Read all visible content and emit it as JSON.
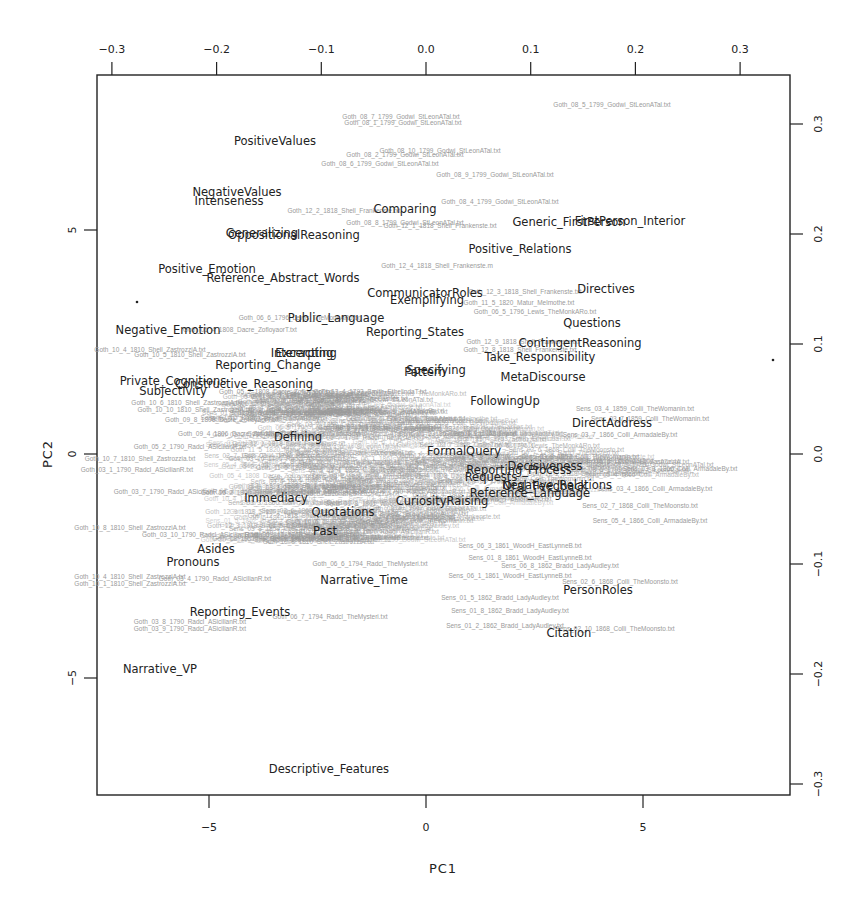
{
  "chart_data": {
    "type": "scatter",
    "subtype": "biplot",
    "title": "",
    "xlabel": "PC1",
    "ylabel": "PC2",
    "xlim": [
      -9.7,
      8.2
    ],
    "ylim": [
      -7.5,
      8.5
    ],
    "bottom_axis": {
      "ticks": [
        -5,
        0,
        5
      ],
      "tick_labels": [
        "−5",
        "0",
        "5"
      ]
    },
    "left_axis": {
      "ticks": [
        5,
        0,
        -5
      ],
      "tick_labels": [
        "5",
        "0",
        "−5"
      ]
    },
    "top_axis": {
      "ticks": [
        -0.3,
        -0.2,
        -0.1,
        0.0,
        0.1,
        0.2,
        0.3
      ],
      "tick_labels": [
        "−0.3",
        "−0.2",
        "−0.1",
        "0.0",
        "0.1",
        "0.2",
        "0.3"
      ]
    },
    "right_axis": {
      "ticks": [
        0.3,
        0.2,
        0.1,
        0.0,
        -0.1,
        -0.2,
        -0.3
      ],
      "tick_labels": [
        "0.3",
        "0.2",
        "0.1",
        "0.0",
        "−0.1",
        "−0.2",
        "−0.3"
      ]
    },
    "grid": false,
    "legend": null,
    "variable_loadings": [
      {
        "name": "PositiveValues",
        "px": 275,
        "py": 145
      },
      {
        "name": "NegativeValues",
        "px": 237,
        "py": 196
      },
      {
        "name": "Intenseness",
        "px": 229,
        "py": 205
      },
      {
        "name": "OppositionalReasoning",
        "px": 294,
        "py": 239
      },
      {
        "name": "Generalizing",
        "px": 262,
        "py": 237
      },
      {
        "name": "Comparing",
        "px": 405,
        "py": 213
      },
      {
        "name": "Generic_FirstPerson",
        "px": 569,
        "py": 226
      },
      {
        "name": "FirstPerson_Interior",
        "px": 630,
        "py": 225
      },
      {
        "name": "Positive_Relations",
        "px": 520,
        "py": 253
      },
      {
        "name": "Positive_Emotion",
        "px": 207,
        "py": 273
      },
      {
        "name": "Reference_Abstract_Words",
        "px": 283,
        "py": 282
      },
      {
        "name": "CommunicatorRoles",
        "px": 425,
        "py": 297
      },
      {
        "name": "Exemplifying",
        "px": 427,
        "py": 304
      },
      {
        "name": "Directives",
        "px": 606,
        "py": 293
      },
      {
        "name": "Public_Language",
        "px": 336,
        "py": 322
      },
      {
        "name": "Negative_Emotion",
        "px": 168,
        "py": 334
      },
      {
        "name": "Reporting_States",
        "px": 415,
        "py": 336
      },
      {
        "name": "Questions",
        "px": 592,
        "py": 327
      },
      {
        "name": "ContingentReasoning",
        "px": 580,
        "py": 347
      },
      {
        "name": "Interacting",
        "px": 302,
        "py": 357
      },
      {
        "name": "Excerpting",
        "px": 306,
        "py": 357
      },
      {
        "name": "Take_Responsibility",
        "px": 540,
        "py": 361
      },
      {
        "name": "Reporting_Change",
        "px": 268,
        "py": 369
      },
      {
        "name": "Specifying",
        "px": 436,
        "py": 374
      },
      {
        "name": "Pattern",
        "px": 425,
        "py": 376
      },
      {
        "name": "MetaDiscourse",
        "px": 543,
        "py": 381
      },
      {
        "name": "Private_Cognitions",
        "px": 173,
        "py": 385
      },
      {
        "name": "Constructive_Reasoning",
        "px": 244,
        "py": 388
      },
      {
        "name": "Subjectivity",
        "px": 173,
        "py": 395
      },
      {
        "name": "FollowingUp",
        "px": 505,
        "py": 405
      },
      {
        "name": "DirectAddress",
        "px": 612,
        "py": 427
      },
      {
        "name": "Defining",
        "px": 298,
        "py": 441
      },
      {
        "name": "FormalQuery",
        "px": 464,
        "py": 455
      },
      {
        "name": "Reporting_Process",
        "px": 519,
        "py": 474
      },
      {
        "name": "Decisiveness",
        "px": 545,
        "py": 470
      },
      {
        "name": "Requests",
        "px": 491,
        "py": 481
      },
      {
        "name": "Negative_Relations",
        "px": 557,
        "py": 489
      },
      {
        "name": "Oral_Feedback",
        "px": 545,
        "py": 490
      },
      {
        "name": "Reference_Language",
        "px": 530,
        "py": 497
      },
      {
        "name": "CuriosityRaising",
        "px": 442,
        "py": 505
      },
      {
        "name": "Immediacy",
        "px": 276,
        "py": 502
      },
      {
        "name": "Quotations",
        "px": 343,
        "py": 516
      },
      {
        "name": "Past",
        "px": 325,
        "py": 535
      },
      {
        "name": "Asides",
        "px": 216,
        "py": 553
      },
      {
        "name": "Pronouns",
        "px": 193,
        "py": 566
      },
      {
        "name": "Narrative_Time",
        "px": 364,
        "py": 584
      },
      {
        "name": "PersonRoles",
        "px": 598,
        "py": 594
      },
      {
        "name": "Reporting_Events",
        "px": 240,
        "py": 616
      },
      {
        "name": "Citation",
        "px": 569,
        "py": 637
      },
      {
        "name": "Narrative_VP",
        "px": 160,
        "py": 673
      },
      {
        "name": "Descriptive_Features",
        "px": 329,
        "py": 773
      }
    ],
    "document_points": [
      {
        "name": "Goth_08_5_1799_Godwi_StLeonATal.txt",
        "px": 612,
        "py": 107
      },
      {
        "name": "Goth_08_7_1799_Godwi_StLeonATal.txt",
        "px": 401,
        "py": 119
      },
      {
        "name": "Goth_08_1_1799_Godwi_StLeonATal.txt",
        "px": 403,
        "py": 125
      },
      {
        "name": "Goth_08_10_1799_Godwi_StLeonATal.txt",
        "px": 440,
        "py": 153
      },
      {
        "name": "Goth_08_2_1799_Godwi_StLeonATal.txt",
        "px": 405,
        "py": 157
      },
      {
        "name": "Goth_08_6_1799_Godwi_StLeonATal.txt",
        "px": 380,
        "py": 166
      },
      {
        "name": "Goth_08_9_1799_Godwi_StLeonATal.txt",
        "px": 495,
        "py": 177
      },
      {
        "name": "Goth_08_4_1799_Godwi_StLeonATal.txt",
        "px": 500,
        "py": 204
      },
      {
        "name": "Goth_12_2_1818_Shell_Frankenste.txt",
        "px": 344,
        "py": 213
      },
      {
        "name": "Goth_08_8_1799_Godwi_StLeonATal.txt",
        "px": 405,
        "py": 225
      },
      {
        "name": "Goth_12_1_1818_Shell_Frankenste.txt",
        "px": 440,
        "py": 228
      },
      {
        "name": "Goth_12_4_1818_Shell_Frankenste.m",
        "px": 437,
        "py": 268
      },
      {
        "name": "Goth_12_3_1818_Shell_Frankenste.txt",
        "px": 525,
        "py": 294
      },
      {
        "name": "Goth_11_5_1820_Matur_Melmothe.txt",
        "px": 519,
        "py": 305
      },
      {
        "name": "Goth_06_5_1796_Lewis_TheMonkARo.txt",
        "px": 535,
        "py": 314
      },
      {
        "name": "Goth_06_6_1796_Lewis_TheMonkARo.txt",
        "px": 300,
        "py": 320
      },
      {
        "name": "Goth_12_9_1818_Shell_Frankenste.txt",
        "px": 523,
        "py": 344
      },
      {
        "name": "Goth_12_8_1818_Shell_Frankenste.txt",
        "px": 520,
        "py": 352
      },
      {
        "name": "Goth_10_4_1810_Shell_ZastrozziA.txt",
        "px": 150,
        "py": 352
      },
      {
        "name": "Goth_10_5_1810_Shell_ZastrozziA.txt",
        "px": 190,
        "py": 357
      },
      {
        "name": "Goth_05_4_1808_Dacre_ZofloyaorT.txt",
        "px": 240,
        "py": 332
      },
      {
        "name": "Goth_05_2_1808_Dacre_ZofloyaorT.txt",
        "px": 276,
        "py": 394
      },
      {
        "name": "Goth_13_4_1793_Smith_EthelindaT.txt",
        "px": 370,
        "py": 394
      },
      {
        "name": "Goth_02_4_1789_Radcl_TheCastles.txt",
        "px": 350,
        "py": 401
      },
      {
        "name": "Goth_10_6_1810_Shell_ZastrozziA.txt",
        "px": 187,
        "py": 405
      },
      {
        "name": "Goth_10_10_1810_Shell_ZastrozziA.txt",
        "px": 195,
        "py": 412
      },
      {
        "name": "Goth_09_8_1806_Dacre_ZofloyaorT.txt",
        "px": 222,
        "py": 422
      },
      {
        "name": "Goth_09_4_1806_Dacre_ZofloyaorT.txt",
        "px": 235,
        "py": 436
      },
      {
        "name": "Goth_05_2_1790_Radcl_ASicilianR.txt",
        "px": 190,
        "py": 449
      },
      {
        "name": "Goth_10_7_1810_Shell_Zastrozzia.txt",
        "px": 140,
        "py": 461
      },
      {
        "name": "Goth_03_1_1790_Radcl_ASicilianR.txt",
        "px": 137,
        "py": 472
      },
      {
        "name": "Goth_03_7_1790_Radcl_ASicilianR.txt",
        "px": 170,
        "py": 494
      },
      {
        "name": "Goth_03_10_1790_Radcl_ASicilianR.txt",
        "px": 200,
        "py": 537
      },
      {
        "name": "Goth_10_8_1810_Shell_ZastrozziA.txt",
        "px": 130,
        "py": 530
      },
      {
        "name": "Goth_06_6_1794_Radcl_TheMysteri.txt",
        "px": 370,
        "py": 566
      },
      {
        "name": "Goth_10_4_1810_Shell_ZastrozziA.txt",
        "px": 130,
        "py": 579
      },
      {
        "name": "Goth_10_1_1810_Shell_ZastrozziA.txt",
        "px": 130,
        "py": 586
      },
      {
        "name": "Goth_03_4_1790_Radcl_ASicilianR.txt",
        "px": 215,
        "py": 581
      },
      {
        "name": "Goth_03_8_1790_Radcl_ASicilianR.txt",
        "px": 190,
        "py": 624
      },
      {
        "name": "Goth_03_9_1790_Radcl_ASicilianR.txt",
        "px": 190,
        "py": 631
      },
      {
        "name": "Goth_06_7_1794_Radcl_TheMysteri.txt",
        "px": 330,
        "py": 619
      },
      {
        "name": "Sens_03_4_1859_Colli_TheWomanin.txt",
        "px": 635,
        "py": 411
      },
      {
        "name": "Sens_03_7_1859_Colli_TheWomanin.txt",
        "px": 650,
        "py": 421
      },
      {
        "name": "Sens_03_7_1866_Colli_ArmadaleBy.txt",
        "px": 620,
        "py": 437
      },
      {
        "name": "Sens_03_8_1859_Colli_TheWomanin.txt",
        "px": 580,
        "py": 459
      },
      {
        "name": "Sens_03_3_1866_Colli_ArmadaleBy.txt",
        "px": 680,
        "py": 471
      },
      {
        "name": "Sens_03_4_1866_Colli_ArmadaleBy.txt",
        "px": 655,
        "py": 491
      },
      {
        "name": "Sens_02_7_1868_Colli_TheMoonsto.txt",
        "px": 640,
        "py": 508
      },
      {
        "name": "Sens_05_4_1866_Colli_ArmadaleBy.txt",
        "px": 650,
        "py": 523
      },
      {
        "name": "Sens_06_3_1861_WoodH_EastLynneB.txt",
        "px": 520,
        "py": 548
      },
      {
        "name": "Sens_01_8_1861_WoodH_EastLynneB.txt",
        "px": 530,
        "py": 560
      },
      {
        "name": "Sens_06_8_1862_Bradd_LadyAudley.txt",
        "px": 560,
        "py": 568
      },
      {
        "name": "Sens_06_1_1861_WoodH_EastLynneB.txt",
        "px": 510,
        "py": 578
      },
      {
        "name": "Sens_02_6_1868_Colli_TheMoonsto.txt",
        "px": 620,
        "py": 584
      },
      {
        "name": "Sens_01_5_1862_Bradd_LadyAudley.txt",
        "px": 500,
        "py": 600
      },
      {
        "name": "Sens_01_8_1862_Bradd_LadyAudley.txt",
        "px": 510,
        "py": 613
      },
      {
        "name": "Sens_01_2_1862_Bradd_LadyAudley.txt",
        "px": 505,
        "py": 628
      },
      {
        "name": "Sens_02_10_1868_Colli_TheMoonsto.txt",
        "px": 615,
        "py": 631
      }
    ]
  },
  "plot_area": {
    "left": 97,
    "top": 75,
    "right": 790,
    "bottom": 795
  },
  "colors": {
    "variable_text": "#222222",
    "document_text": "#9a9a9a",
    "axis": "#222222",
    "background": "#ffffff"
  }
}
